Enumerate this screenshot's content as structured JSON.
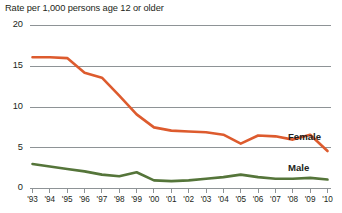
{
  "chart_data": {
    "type": "line",
    "title": "Rate per 1,000 persons age 12 or older",
    "xlabel": "",
    "ylabel": "Rate per 1,000 persons age 12 or older",
    "grid": true,
    "legend_position": "inline-right",
    "ylim": [
      0,
      20
    ],
    "yticks": [
      0,
      5,
      10,
      15,
      20
    ],
    "ytick_labels": [
      "0",
      "5",
      "10",
      "15",
      "20"
    ],
    "categories": [
      "'93",
      "'94",
      "'95",
      "'96",
      "'97",
      "'98",
      "'99",
      "'00",
      "'01",
      "'02",
      "'03",
      "'04",
      "'05",
      "'06",
      "'07",
      "'08",
      "'09",
      "'10"
    ],
    "x": [
      1993,
      1994,
      1995,
      1996,
      1997,
      1998,
      1999,
      2000,
      2001,
      2002,
      2003,
      2004,
      2005,
      2006,
      2007,
      2008,
      2009,
      2010
    ],
    "series": [
      {
        "name": "Female",
        "color": "#dd5b2e",
        "values": [
          16.1,
          16.1,
          16.0,
          14.2,
          13.6,
          11.4,
          9.1,
          7.5,
          7.1,
          7.0,
          6.9,
          6.6,
          5.5,
          6.5,
          6.4,
          6.0,
          6.6,
          4.6
        ]
      },
      {
        "name": "Male",
        "color": "#55753a",
        "values": [
          3.0,
          2.7,
          2.4,
          2.1,
          1.7,
          1.5,
          2.0,
          1.0,
          0.9,
          1.0,
          1.2,
          1.4,
          1.7,
          1.4,
          1.2,
          1.2,
          1.3,
          1.1
        ]
      }
    ],
    "annotations": [
      {
        "text": "Female",
        "series": "Female"
      },
      {
        "text": "Male",
        "series": "Male"
      }
    ],
    "colors": {
      "female_line": "#dd5b2e",
      "male_line": "#55753a",
      "gridline": "#8e9396",
      "axis_text": "#231f20",
      "background": "#ffffff"
    }
  }
}
